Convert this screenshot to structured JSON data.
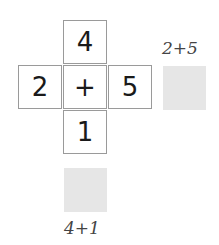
{
  "cross": {
    "top": "4",
    "left": "2",
    "center": "+",
    "right": "5",
    "bottom": "1"
  },
  "answers": {
    "horizontal": {
      "label": "2+5",
      "box_color": "#e6e6e6"
    },
    "vertical": {
      "label": "4+1",
      "box_color": "#e6e6e6"
    }
  }
}
